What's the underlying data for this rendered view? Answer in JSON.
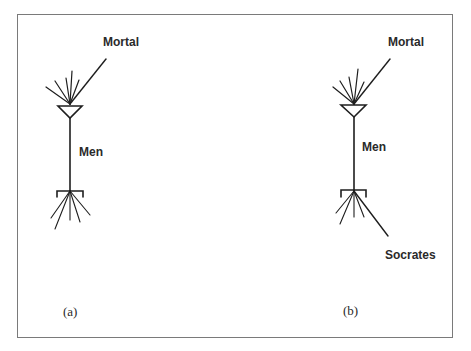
{
  "figure": {
    "panels": [
      {
        "id": "a",
        "caption": "(a)",
        "labels": {
          "input": "Mortal",
          "cell": "Men"
        }
      },
      {
        "id": "b",
        "caption": "(b)",
        "labels": {
          "input": "Mortal",
          "cell": "Men",
          "output": "Socrates"
        }
      }
    ]
  },
  "colors": {
    "stroke": "#1e1e1e",
    "frame": "#7a7a7a",
    "background": "#ffffff"
  }
}
